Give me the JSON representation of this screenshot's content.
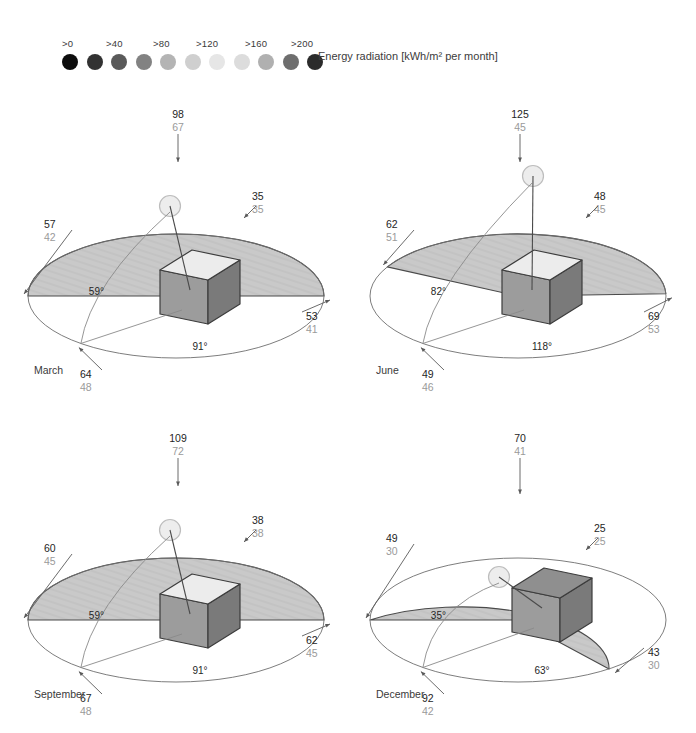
{
  "legend": {
    "caption": "Energy radiation [kWh/m² per month]",
    "ticks": [
      ">0",
      ">40",
      ">80",
      ">120",
      ">160",
      ">200"
    ],
    "swatch_colors": [
      "#0d0d0d",
      "#323232",
      "#5a5a5a",
      "#828282",
      "#b4b4b4",
      "#cfcfcf",
      "#e6e6e6",
      "#dcdcdc",
      "#b0b0b0",
      "#6e6e6e",
      "#2b2b2b"
    ],
    "swatch_count": 11
  },
  "colors": {
    "ellipse_stroke": "#6e6e6e",
    "sector_fill": "#c9c9c9",
    "sector_stroke": "#4a4a4a",
    "cube_top": "#ececec",
    "cube_top_dark": "#8f8f8f",
    "cube_left": "#9c9c9c",
    "cube_right": "#7a7a7a",
    "cube_stroke": "#3c3c3c",
    "sun_fill": "#ededed",
    "sun_stroke": "#bdbdbd",
    "label_main": "#252525",
    "label_sub": "#9a9a9a",
    "leader": "#5a5a5a"
  },
  "panels": [
    {
      "id": "march",
      "month": "March",
      "sun_elevation_deg": "59°",
      "azimuth_span_deg": "91°",
      "cube_top_shade": "light",
      "sun_pos": {
        "x": 118,
        "y": 88
      },
      "labels": {
        "top": {
          "main": "98",
          "sub": "67"
        },
        "left": {
          "main": "57",
          "sub": "42"
        },
        "right_upper": {
          "main": "35",
          "sub": "35"
        },
        "right_lower": {
          "main": "53",
          "sub": "41"
        },
        "bottom": {
          "main": "64",
          "sub": "48"
        }
      }
    },
    {
      "id": "june",
      "month": "June",
      "sun_elevation_deg": "82°",
      "azimuth_span_deg": "118°",
      "cube_top_shade": "light",
      "sun_pos": {
        "x": 139,
        "y": 58
      },
      "labels": {
        "top": {
          "main": "125",
          "sub": "45"
        },
        "left": {
          "main": "62",
          "sub": "51"
        },
        "right_upper": {
          "main": "48",
          "sub": "45"
        },
        "right_lower": {
          "main": "69",
          "sub": "53"
        },
        "bottom": {
          "main": "49",
          "sub": "46"
        }
      }
    },
    {
      "id": "september",
      "month": "September",
      "sun_elevation_deg": "59°",
      "azimuth_span_deg": "91°",
      "cube_top_shade": "light",
      "sun_pos": {
        "x": 118,
        "y": 88
      },
      "labels": {
        "top": {
          "main": "109",
          "sub": "72"
        },
        "left": {
          "main": "60",
          "sub": "45"
        },
        "right_upper": {
          "main": "38",
          "sub": "38"
        },
        "right_lower": {
          "main": "62",
          "sub": "45"
        },
        "bottom": {
          "main": "67",
          "sub": "48"
        }
      }
    },
    {
      "id": "december",
      "month": "December",
      "sun_elevation_deg": "35°",
      "azimuth_span_deg": "63°",
      "cube_top_shade": "dark",
      "sun_pos": {
        "x": 105,
        "y": 135
      },
      "labels": {
        "top": {
          "main": "70",
          "sub": "41"
        },
        "left": {
          "main": "49",
          "sub": "30"
        },
        "right_upper": {
          "main": "25",
          "sub": "25"
        },
        "right_lower": {
          "main": "43",
          "sub": "30"
        },
        "bottom": {
          "main": "92",
          "sub": "42"
        }
      }
    }
  ]
}
